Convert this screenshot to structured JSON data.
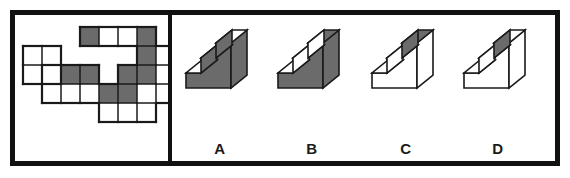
{
  "figure": {
    "border_color": "#111111",
    "background_color": "#ffffff",
    "fill_gray": "#6b6b6b",
    "fill_white": "#ffffff",
    "stroke_color": "#1a1a1a"
  },
  "left_panel": {
    "name": "unfolded-net",
    "description": "Unfolded net of a stepped solid drawn on a square grid with shaded and unshaded faces",
    "cell_size": 19,
    "grid_origin_x": 8,
    "grid_origin_y": 12,
    "cells": [
      {
        "col": 3,
        "row": 0,
        "fill": "gray"
      },
      {
        "col": 4,
        "row": 0,
        "fill": "white"
      },
      {
        "col": 5,
        "row": 0,
        "fill": "white"
      },
      {
        "col": 6,
        "row": 0,
        "fill": "gray"
      },
      {
        "col": 0,
        "row": 1,
        "fill": "white"
      },
      {
        "col": 1,
        "row": 1,
        "fill": "white"
      },
      {
        "col": 6,
        "row": 1,
        "fill": "gray"
      },
      {
        "col": 7,
        "row": 1,
        "fill": "white"
      },
      {
        "col": 0,
        "row": 2,
        "fill": "white"
      },
      {
        "col": 2,
        "row": 2,
        "fill": "gray"
      },
      {
        "col": 3,
        "row": 2,
        "fill": "gray"
      },
      {
        "col": 5,
        "row": 2,
        "fill": "gray"
      },
      {
        "col": 6,
        "row": 2,
        "fill": "gray"
      },
      {
        "col": 7,
        "row": 2,
        "fill": "white"
      },
      {
        "col": 1,
        "row": 3,
        "fill": "white"
      },
      {
        "col": 2,
        "row": 3,
        "fill": "white"
      },
      {
        "col": 3,
        "row": 3,
        "fill": "white"
      },
      {
        "col": 4,
        "row": 3,
        "fill": "gray"
      },
      {
        "col": 5,
        "row": 3,
        "fill": "gray"
      },
      {
        "col": 6,
        "row": 3,
        "fill": "white"
      },
      {
        "col": 7,
        "row": 3,
        "fill": "white"
      },
      {
        "col": 4,
        "row": 4,
        "fill": "white"
      },
      {
        "col": 5,
        "row": 4,
        "fill": "white"
      },
      {
        "col": 6,
        "row": 4,
        "fill": "white"
      }
    ]
  },
  "right_panel": {
    "name": "answer-options",
    "options": [
      {
        "id": "A",
        "label": "A",
        "description": "Stepped block, front-left vertical faces shaded gray, top faces white",
        "top_fill": "white",
        "front_fill": "gray",
        "side_fill": "gray"
      },
      {
        "id": "B",
        "label": "B",
        "description": "Stepped block, top faces shaded gray and step risers shaded, front faces gray",
        "top_fill": "gray",
        "front_fill": "gray",
        "side_fill": "gray"
      },
      {
        "id": "C",
        "label": "C",
        "description": "Stepped block, upper rear top face shaded gray, remaining faces white",
        "top_fill": "gray",
        "front_fill": "white",
        "side_fill": "white"
      },
      {
        "id": "D",
        "label": "D",
        "description": "Stepped block, one small step riser shaded gray, remaining faces white",
        "top_fill": "white",
        "front_fill": "white",
        "side_fill": "white"
      }
    ]
  }
}
